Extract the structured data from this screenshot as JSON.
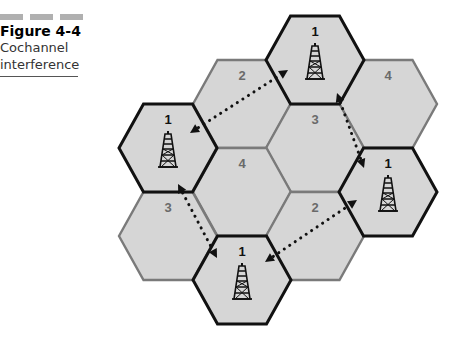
{
  "caption": {
    "figure_number": "Figure 4-4",
    "title_line1": "Cochannel",
    "title_line2": "interference"
  },
  "diagram": {
    "fill_color": "#d6d6d6",
    "outline_cochannel": "#111111",
    "outline_other": "#7a7a7a",
    "cells": [
      {
        "label": "1",
        "cx": 315,
        "cy": 60,
        "cochannel": true
      },
      {
        "label": "2",
        "cx": 242,
        "cy": 104,
        "cochannel": false
      },
      {
        "label": "4",
        "cx": 388,
        "cy": 104,
        "cochannel": false
      },
      {
        "label": "1",
        "cx": 168,
        "cy": 148,
        "cochannel": true
      },
      {
        "label": "3",
        "cx": 315,
        "cy": 148,
        "cochannel": false
      },
      {
        "label": "4",
        "cx": 242,
        "cy": 192,
        "cochannel": false
      },
      {
        "label": "1",
        "cx": 388,
        "cy": 192,
        "cochannel": true
      },
      {
        "label": "3",
        "cx": 168,
        "cy": 236,
        "cochannel": false
      },
      {
        "label": "2",
        "cx": 315,
        "cy": 236,
        "cochannel": false
      },
      {
        "label": "1",
        "cx": 242,
        "cy": 280,
        "cochannel": true
      }
    ],
    "interference_links": [
      {
        "from": [
          190,
          133
        ],
        "to": [
          288,
          70
        ]
      },
      {
        "from": [
          337,
          93
        ],
        "to": [
          364,
          168
        ]
      },
      {
        "from": [
          265,
          262
        ],
        "to": [
          357,
          200
        ]
      },
      {
        "from": [
          178,
          184
        ],
        "to": [
          217,
          258
        ]
      }
    ]
  }
}
